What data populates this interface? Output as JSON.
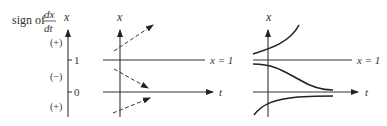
{
  "sign_column": {
    "title_prefix": "sign of",
    "fraction_num": "dx",
    "fraction_den": "dt",
    "axis_label": "x",
    "signs": [
      "(+)",
      "(−)",
      "(+)"
    ],
    "ticks": [
      "1",
      "0"
    ]
  },
  "direction_field": {
    "axis_x_label": "x",
    "axis_t_label": "t",
    "line_label": "x = 1"
  },
  "solution_curves": {
    "axis_x_label": "x",
    "axis_t_label": "t",
    "line_label": "x = 1"
  },
  "colors": {
    "ink": "#222222",
    "background": "#ffffff"
  }
}
